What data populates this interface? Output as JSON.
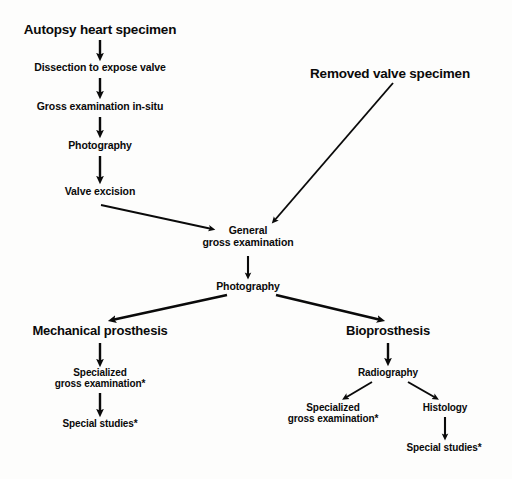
{
  "figure": {
    "kind": "flowchart",
    "background_color": "#fdfdfc",
    "ink_color": "#0a0a0a"
  },
  "nodes": {
    "autopsy_heart_specimen": "Autopsy heart specimen",
    "dissection": "Dissection to expose valve",
    "gross_exam_in_situ": "Gross examination in-situ",
    "photography_top": "Photography",
    "valve_excision": "Valve excision",
    "removed_valve_specimen": "Removed valve specimen",
    "general_gross_exam_line1": "General",
    "general_gross_exam_line2": "gross examination",
    "photography_mid": "Photography",
    "mechanical_prosthesis": "Mechanical prosthesis",
    "bioprosthesis": "Bioprosthesis",
    "mech_specialized_line1": "Specialized",
    "mech_specialized_line2": "gross examination*",
    "mech_special_studies": "Special studies*",
    "radiography": "Radiography",
    "bio_specialized_line1": "Specialized",
    "bio_specialized_line2": "gross examination*",
    "histology": "Histology",
    "bio_special_studies": "Special studies*"
  },
  "edges": [
    {
      "name": "autopsy-to-dissection",
      "from": "autopsy_heart_specimen",
      "to": "dissection",
      "style": "thick-vertical"
    },
    {
      "name": "dissection-to-gross-exam-in-situ",
      "from": "dissection",
      "to": "gross_exam_in_situ",
      "style": "thick-vertical"
    },
    {
      "name": "gross-exam-in-situ-to-photography",
      "from": "gross_exam_in_situ",
      "to": "photography_top",
      "style": "thick-vertical"
    },
    {
      "name": "photography-to-valve-excision",
      "from": "photography_top",
      "to": "valve_excision",
      "style": "thick-vertical"
    },
    {
      "name": "valve-excision-to-general-gross-exam",
      "from": "valve_excision",
      "to": "general_gross_exam_line1",
      "style": "thin-diagonal"
    },
    {
      "name": "removed-valve-to-general-gross-exam",
      "from": "removed_valve_specimen",
      "to": "general_gross_exam_line1",
      "style": "thin-diagonal"
    },
    {
      "name": "general-gross-exam-to-photography",
      "from": "general_gross_exam_line2",
      "to": "photography_mid",
      "style": "thin-vertical"
    },
    {
      "name": "photography-to-mechanical-prosthesis",
      "from": "photography_mid",
      "to": "mechanical_prosthesis",
      "style": "thick-diagonal"
    },
    {
      "name": "photography-to-bioprosthesis",
      "from": "photography_mid",
      "to": "bioprosthesis",
      "style": "thick-diagonal"
    },
    {
      "name": "mechanical-to-specialized-gross-exam",
      "from": "mechanical_prosthesis",
      "to": "mech_specialized_line1",
      "style": "thick-vertical"
    },
    {
      "name": "specialized-gross-exam-to-special-studies",
      "from": "mech_specialized_line2",
      "to": "mech_special_studies",
      "style": "thick-vertical"
    },
    {
      "name": "bioprosthesis-to-radiography",
      "from": "bioprosthesis",
      "to": "radiography",
      "style": "thick-vertical"
    },
    {
      "name": "radiography-to-specialized-gross-exam",
      "from": "radiography",
      "to": "bio_specialized_line1",
      "style": "thin-diagonal"
    },
    {
      "name": "radiography-to-histology",
      "from": "radiography",
      "to": "histology",
      "style": "thin-diagonal"
    },
    {
      "name": "histology-to-special-studies",
      "from": "histology",
      "to": "bio_special_studies",
      "style": "thin-vertical"
    }
  ],
  "footnote_marker": "*"
}
